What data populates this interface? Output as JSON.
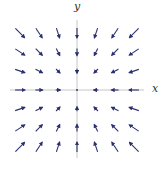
{
  "diagram": {
    "type": "vector_field",
    "axes": {
      "x_label": "x",
      "y_label": "y"
    },
    "grid": {
      "x_values": [
        -3,
        -2,
        -1,
        0,
        1,
        2,
        3
      ],
      "y_values": [
        -3,
        -2,
        -1,
        0,
        1,
        2,
        3
      ]
    },
    "colors": {
      "arrow": "#2b3070",
      "axis": "#b8b8b8"
    }
  }
}
